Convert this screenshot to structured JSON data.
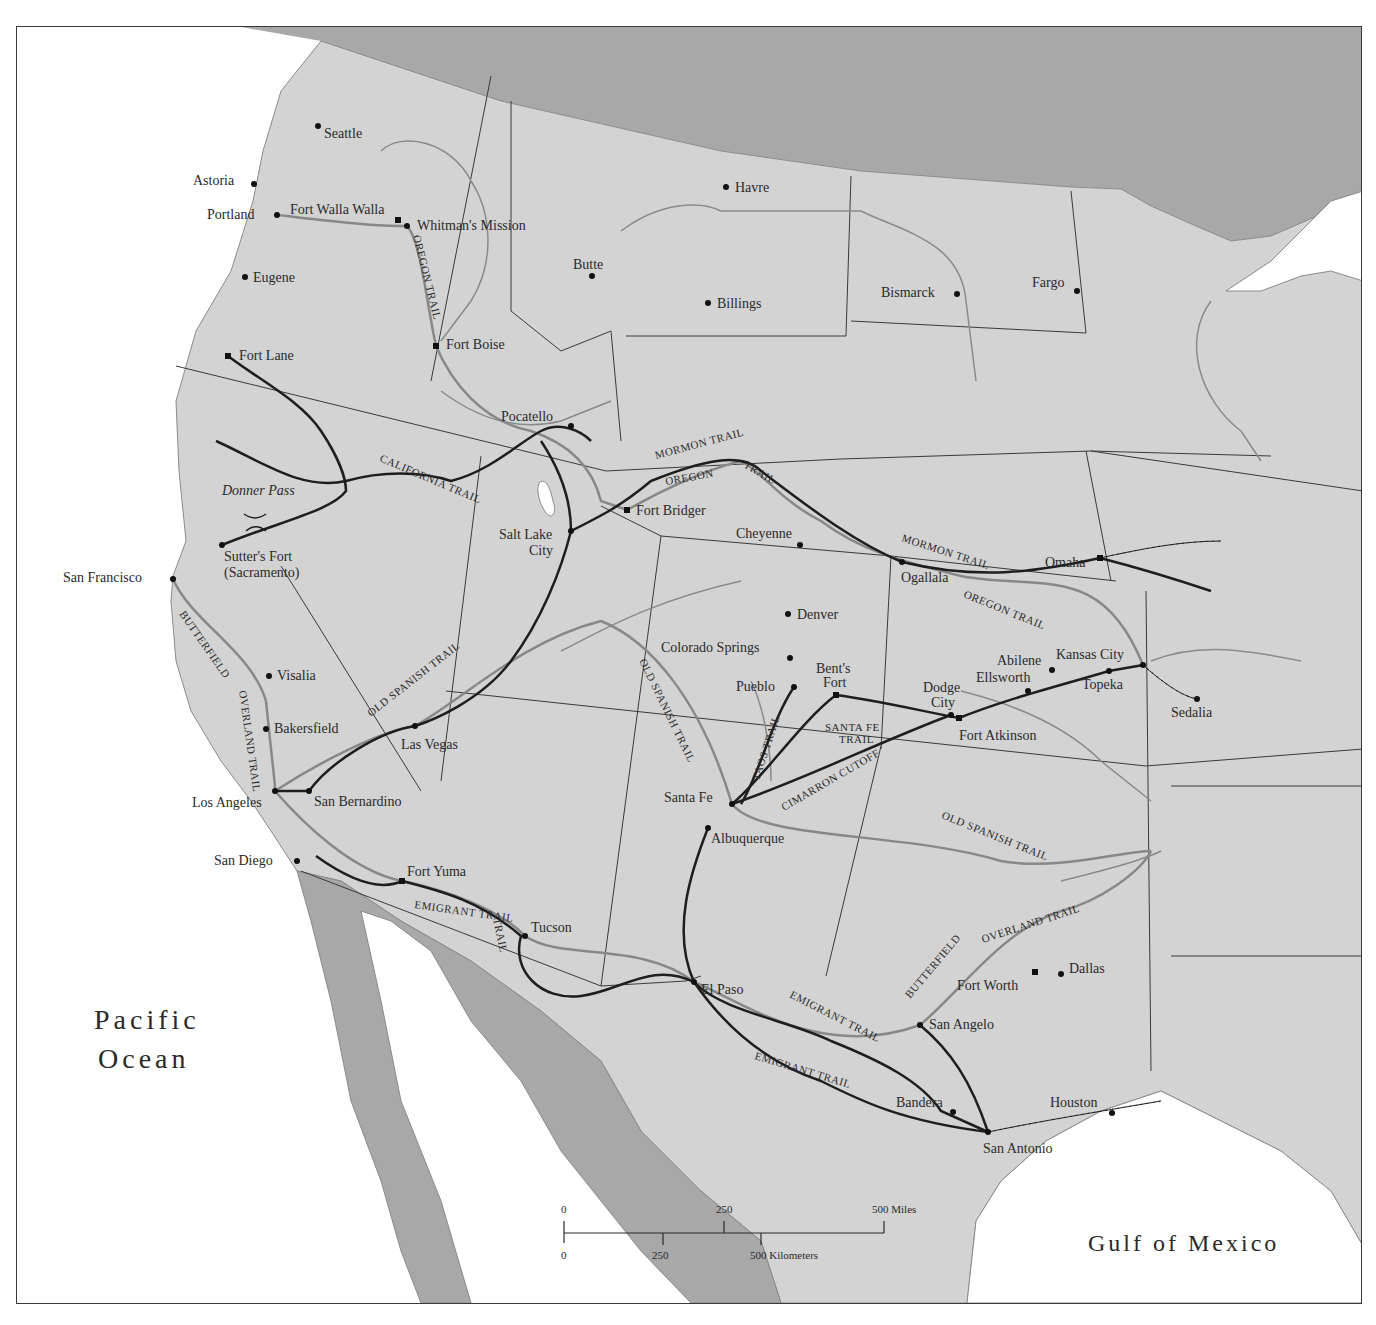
{
  "map": {
    "water_labels": {
      "pacific": [
        "Pacific",
        "Ocean"
      ],
      "gulf": "Gulf of Mexico"
    },
    "cities": [
      {
        "name": "Seattle",
        "x": 317,
        "y": 125,
        "lx": 323,
        "ly": 137,
        "marker": "dot"
      },
      {
        "name": "Astoria",
        "x": 253,
        "y": 183,
        "lx": 192,
        "ly": 184,
        "marker": "dot"
      },
      {
        "name": "Portland",
        "x": 276,
        "y": 214,
        "lx": 206,
        "ly": 218,
        "marker": "dot"
      },
      {
        "name": "Fort Walla Walla",
        "x": 397,
        "y": 219,
        "lx": 289,
        "ly": 213,
        "marker": "square"
      },
      {
        "name": "Whitman's Mission",
        "x": 406,
        "y": 225,
        "lx": 416,
        "ly": 229,
        "marker": "dot"
      },
      {
        "name": "Eugene",
        "x": 244,
        "y": 276,
        "lx": 252,
        "ly": 281,
        "marker": "dot"
      },
      {
        "name": "Havre",
        "x": 725,
        "y": 186,
        "lx": 734,
        "ly": 191,
        "marker": "dot"
      },
      {
        "name": "Butte",
        "x": 591,
        "y": 275,
        "lx": 572,
        "ly": 268,
        "marker": "dot"
      },
      {
        "name": "Billings",
        "x": 707,
        "y": 302,
        "lx": 716,
        "ly": 307,
        "marker": "dot"
      },
      {
        "name": "Bismarck",
        "x": 956,
        "y": 293,
        "lx": 880,
        "ly": 296,
        "marker": "dot"
      },
      {
        "name": "Fargo",
        "x": 1076,
        "y": 290,
        "lx": 1031,
        "ly": 286,
        "marker": "dot"
      },
      {
        "name": "Fort Lane",
        "x": 227,
        "y": 355,
        "lx": 238,
        "ly": 359,
        "marker": "square"
      },
      {
        "name": "Fort Boise",
        "x": 435,
        "y": 345,
        "lx": 445,
        "ly": 348,
        "marker": "square"
      },
      {
        "name": "Pocatello",
        "x": 570,
        "y": 425,
        "lx": 500,
        "ly": 420,
        "marker": "dot"
      },
      {
        "name": "Donner Pass",
        "x": 240,
        "y": 470,
        "lx": 221,
        "ly": 494,
        "marker": "none",
        "italic": true
      },
      {
        "name": "Sutter's Fort",
        "x": 221,
        "y": 544,
        "lx": 223,
        "ly": 560,
        "marker": "dot"
      },
      {
        "name": "(Sacramento)",
        "x": 221,
        "y": 544,
        "lx": 223,
        "ly": 576,
        "marker": "none"
      },
      {
        "name": "Fort Bridger",
        "x": 626,
        "y": 509,
        "lx": 635,
        "ly": 514,
        "marker": "square"
      },
      {
        "name": "Salt Lake",
        "x": 570,
        "y": 530,
        "lx": 498,
        "ly": 538,
        "marker": "dot"
      },
      {
        "name": "City",
        "x": 570,
        "y": 530,
        "lx": 528,
        "ly": 554,
        "marker": "none"
      },
      {
        "name": "Cheyenne",
        "x": 799,
        "y": 544,
        "lx": 735,
        "ly": 537,
        "marker": "dot"
      },
      {
        "name": "Ogallala",
        "x": 901,
        "y": 561,
        "lx": 900,
        "ly": 581,
        "marker": "dot"
      },
      {
        "name": "Omaha",
        "x": 1099,
        "y": 557,
        "lx": 1044,
        "ly": 566,
        "marker": "square"
      },
      {
        "name": "San Francisco",
        "x": 172,
        "y": 578,
        "lx": 62,
        "ly": 581,
        "marker": "dot"
      },
      {
        "name": "Denver",
        "x": 787,
        "y": 613,
        "lx": 796,
        "ly": 618,
        "marker": "dot"
      },
      {
        "name": "Colorado Springs",
        "x": 789,
        "y": 657,
        "lx": 660,
        "ly": 651,
        "marker": "dot"
      },
      {
        "name": "Bent's",
        "x": 835,
        "y": 694,
        "lx": 815,
        "ly": 672,
        "marker": "square"
      },
      {
        "name": "Fort",
        "x": 835,
        "y": 694,
        "lx": 822,
        "ly": 686,
        "marker": "none"
      },
      {
        "name": "Pueblo",
        "x": 793,
        "y": 686,
        "lx": 735,
        "ly": 690,
        "marker": "dot"
      },
      {
        "name": "Visalia",
        "x": 268,
        "y": 675,
        "lx": 276,
        "ly": 679,
        "marker": "dot"
      },
      {
        "name": "Abilene",
        "x": 1051,
        "y": 669,
        "lx": 996,
        "ly": 664,
        "marker": "dot"
      },
      {
        "name": "Kansas City",
        "x": 1142,
        "y": 664,
        "lx": 1055,
        "ly": 658,
        "marker": "dot"
      },
      {
        "name": "Ellsworth",
        "x": 1027,
        "y": 690,
        "lx": 975,
        "ly": 681,
        "marker": "dot"
      },
      {
        "name": "Topeka",
        "x": 1108,
        "y": 670,
        "lx": 1081,
        "ly": 688,
        "marker": "dot"
      },
      {
        "name": "Sedalia",
        "x": 1196,
        "y": 698,
        "lx": 1170,
        "ly": 716,
        "marker": "dot"
      },
      {
        "name": "Dodge",
        "x": 950,
        "y": 714,
        "lx": 922,
        "ly": 691,
        "marker": "dot"
      },
      {
        "name": "City",
        "x": 950,
        "y": 714,
        "lx": 930,
        "ly": 706,
        "marker": "none"
      },
      {
        "name": "Fort Atkinson",
        "x": 958,
        "y": 717,
        "lx": 958,
        "ly": 739,
        "marker": "square"
      },
      {
        "name": "Bakersfield",
        "x": 265,
        "y": 728,
        "lx": 273,
        "ly": 732,
        "marker": "dot"
      },
      {
        "name": "Las Vegas",
        "x": 414,
        "y": 725,
        "lx": 400,
        "ly": 748,
        "marker": "dot"
      },
      {
        "name": "Los Angeles",
        "x": 274,
        "y": 790,
        "lx": 191,
        "ly": 806,
        "marker": "dot"
      },
      {
        "name": "San Bernardino",
        "x": 308,
        "y": 790,
        "lx": 313,
        "ly": 805,
        "marker": "dot"
      },
      {
        "name": "Santa Fe",
        "x": 731,
        "y": 803,
        "lx": 663,
        "ly": 801,
        "marker": "dot"
      },
      {
        "name": "Albuquerque",
        "x": 707,
        "y": 827,
        "lx": 710,
        "ly": 842,
        "marker": "dot"
      },
      {
        "name": "San Diego",
        "x": 296,
        "y": 860,
        "lx": 213,
        "ly": 864,
        "marker": "dot"
      },
      {
        "name": "Fort Yuma",
        "x": 401,
        "y": 880,
        "lx": 406,
        "ly": 875,
        "marker": "square"
      },
      {
        "name": "Tucson",
        "x": 524,
        "y": 935,
        "lx": 530,
        "ly": 931,
        "marker": "dot"
      },
      {
        "name": "Dallas",
        "x": 1060,
        "y": 973,
        "lx": 1068,
        "ly": 972,
        "marker": "dot"
      },
      {
        "name": "Fort Worth",
        "x": 1034,
        "y": 971,
        "lx": 956,
        "ly": 989,
        "marker": "square"
      },
      {
        "name": "El Paso",
        "x": 693,
        "y": 981,
        "lx": 700,
        "ly": 993,
        "marker": "dot"
      },
      {
        "name": "San Angelo",
        "x": 919,
        "y": 1024,
        "lx": 928,
        "ly": 1028,
        "marker": "dot"
      },
      {
        "name": "Bandera",
        "x": 952,
        "y": 1111,
        "lx": 895,
        "ly": 1106,
        "marker": "dot"
      },
      {
        "name": "Houston",
        "x": 1111,
        "y": 1112,
        "lx": 1049,
        "ly": 1106,
        "marker": "dot"
      },
      {
        "name": "San Antonio",
        "x": 987,
        "y": 1131,
        "lx": 982,
        "ly": 1152,
        "marker": "dot"
      }
    ],
    "trail_labels": [
      {
        "text": "OREGON TRAIL",
        "x": 412,
        "y": 235,
        "rotate": 76
      },
      {
        "text": "CALIFORNIA TRAIL",
        "x": 378,
        "y": 460,
        "rotate": 23
      },
      {
        "text": "MORMON TRAIL",
        "x": 655,
        "y": 458,
        "rotate": -15
      },
      {
        "text": "OREGON",
        "x": 665,
        "y": 484,
        "rotate": -10
      },
      {
        "text": "TRAIL",
        "x": 742,
        "y": 466,
        "rotate": 30
      },
      {
        "text": "MORMON TRAIL",
        "x": 900,
        "y": 540,
        "rotate": 18
      },
      {
        "text": "OREGON TRAIL",
        "x": 962,
        "y": 596,
        "rotate": 22
      },
      {
        "text": "OLD SPANISH TRAIL",
        "x": 370,
        "y": 716,
        "rotate": -38
      },
      {
        "text": "BUTTERFIELD",
        "x": 178,
        "y": 613,
        "rotate": 55
      },
      {
        "text": "OVERLAND TRAIL",
        "x": 238,
        "y": 690,
        "rotate": 82
      },
      {
        "text": "OLD SPANISH TRAIL",
        "x": 638,
        "y": 660,
        "rotate": 64
      },
      {
        "text": "TAOS TRAIL",
        "x": 758,
        "y": 780,
        "rotate": -72
      },
      {
        "text": "SANTA FE",
        "x": 824,
        "y": 730,
        "rotate": 0
      },
      {
        "text": "TRAIL",
        "x": 838,
        "y": 742,
        "rotate": 0
      },
      {
        "text": "CIMARRON CUTOFF",
        "x": 783,
        "y": 810,
        "rotate": -30
      },
      {
        "text": "OLD SPANISH TRAIL",
        "x": 940,
        "y": 817,
        "rotate": 22
      },
      {
        "text": "EMIGRANT TRAIL",
        "x": 413,
        "y": 907,
        "rotate": 8
      },
      {
        "text": "TRAIL",
        "x": 492,
        "y": 918,
        "rotate": 78
      },
      {
        "text": "BUTTERFIELD",
        "x": 909,
        "y": 998,
        "rotate": -50
      },
      {
        "text": "OVERLAND TRAIL",
        "x": 982,
        "y": 942,
        "rotate": -18
      },
      {
        "text": "EMIGRANT TRAIL",
        "x": 788,
        "y": 996,
        "rotate": 27
      },
      {
        "text": "EMIGRANT TRAIL",
        "x": 753,
        "y": 1058,
        "rotate": 17
      }
    ],
    "scale_bar": {
      "miles_labels": [
        "0",
        "250",
        "500 Miles"
      ],
      "km_labels": [
        "0",
        "250",
        "500 Kilometers"
      ]
    }
  }
}
